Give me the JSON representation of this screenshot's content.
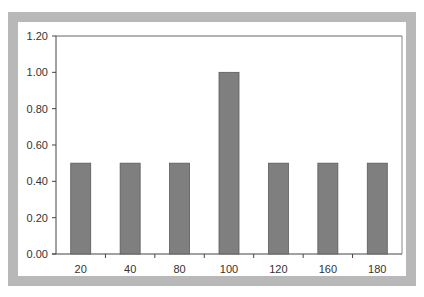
{
  "chart_data": {
    "type": "bar",
    "title": "",
    "xlabel": "",
    "ylabel": "",
    "categories": [
      "20",
      "40",
      "80",
      "100",
      "120",
      "160",
      "180"
    ],
    "values": [
      0.5,
      0.5,
      0.5,
      1.0,
      0.5,
      0.5,
      0.5
    ],
    "ylim": [
      0,
      1.2
    ],
    "yticks": [
      "0.00",
      "0.20",
      "0.40",
      "0.60",
      "0.80",
      "1.00",
      "1.20"
    ],
    "grid": false,
    "legend": null,
    "bar_color": "#7f7f7f",
    "frame_color": "#b8b8b8"
  }
}
